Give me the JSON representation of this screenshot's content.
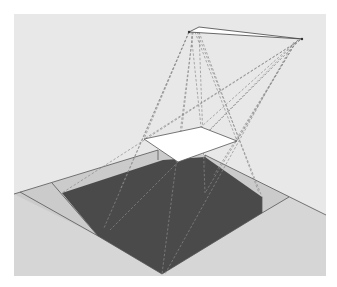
{
  "diagram": {
    "colors": {
      "page_background": "#ffffff",
      "wall": "#e8e8e8",
      "floor": "#d6d6d6",
      "penumbra": "#cdcdcd",
      "shadow": "#4a4a4a",
      "panel": "#ffffff",
      "edge": "#555555",
      "ray": "#888888"
    },
    "light_source": {
      "left_point": [
        189,
        32
      ],
      "apex_point": [
        199,
        27
      ],
      "right_point": [
        302,
        39
      ]
    },
    "panel": {
      "corners": [
        [
          144,
          139
        ],
        [
          201,
          127
        ],
        [
          237,
          141
        ],
        [
          178,
          162
        ]
      ]
    },
    "floor": {
      "back_edge_left": [
        [
          14,
          194
        ],
        [
          158,
          150
        ]
      ],
      "back_edge_right": [
        [
          205,
          155
        ],
        [
          326,
          215
        ]
      ]
    },
    "shadow": {
      "umbra": [
        [
          62,
          193
        ],
        [
          163,
          160
        ],
        [
          205,
          157
        ],
        [
          262,
          197
        ],
        [
          262,
          213
        ],
        [
          162,
          274
        ],
        [
          98,
          236
        ]
      ]
    }
  }
}
